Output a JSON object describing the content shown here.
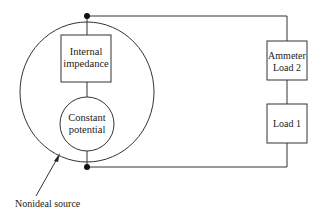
{
  "diagram": {
    "internal_impedance": {
      "line1": "Internal",
      "line2": "impedance"
    },
    "constant_potential": {
      "line1": "Constant",
      "line2": "potential"
    },
    "ammeter_load2": {
      "line1": "Ammeter",
      "line2": "Load 2"
    },
    "load1": {
      "label": "Load 1"
    },
    "caption": "Nonideal source"
  }
}
